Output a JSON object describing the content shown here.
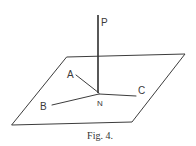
{
  "figure": {
    "caption": "Fig. 4.",
    "labels": {
      "P": "P",
      "A": "A",
      "B": "B",
      "C": "C",
      "N": "N"
    },
    "plane": {
      "points": [
        [
          67,
          57
        ],
        [
          185,
          54
        ],
        [
          132,
          122
        ],
        [
          12,
          125
        ]
      ]
    },
    "normal_line": {
      "from": [
        98,
        93
      ],
      "to": [
        98,
        15
      ]
    },
    "lines": [
      {
        "name": "NA",
        "from": [
          99,
          93
        ],
        "to": [
          76,
          75
        ]
      },
      {
        "name": "NB",
        "from": [
          99,
          94
        ],
        "to": [
          52,
          105
        ]
      },
      {
        "name": "NC",
        "from": [
          99,
          94
        ],
        "to": [
          136,
          96
        ]
      }
    ],
    "colors": {
      "ink": "#3c3c3c",
      "background": "#ffffff"
    }
  }
}
